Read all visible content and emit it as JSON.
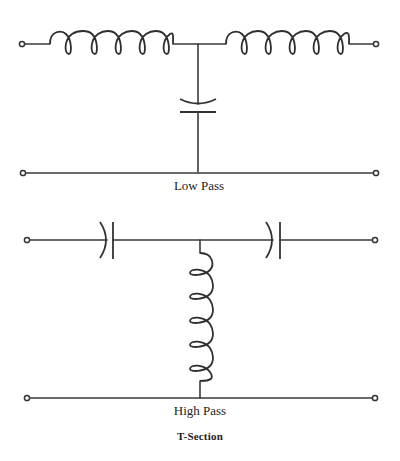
{
  "diagram": {
    "title": "T-Section",
    "circuits": [
      {
        "id": "low-pass",
        "label": "Low Pass",
        "series_elements": [
          "inductor",
          "inductor"
        ],
        "shunt_element": "capacitor"
      },
      {
        "id": "high-pass",
        "label": "High Pass",
        "series_elements": [
          "capacitor",
          "capacitor"
        ],
        "shunt_element": "inductor"
      }
    ],
    "line_color": "#333333",
    "background": "#ffffff"
  }
}
